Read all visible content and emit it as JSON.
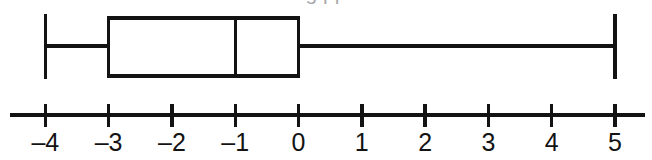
{
  "figure": {
    "kind": "box-plot-on-number-line",
    "ink_color": "#131313",
    "background_color": "#ffffff",
    "cropped_header_remnant": "g pp"
  },
  "axis": {
    "line_y": 115,
    "line_x_start": 10,
    "line_x_end": 645,
    "tick_top_y": 104,
    "tick_bottom_y": 127,
    "label_baseline_y": 151,
    "pixel_per_unit": 63.3,
    "x_at_zero": 298.5,
    "labels": [
      "–4",
      "–3",
      "–2",
      "–1",
      "0",
      "1",
      "2",
      "3",
      "4",
      "5"
    ],
    "values": [
      -4,
      -3,
      -2,
      -1,
      0,
      1,
      2,
      3,
      4,
      5
    ]
  },
  "chart_data": {
    "type": "box",
    "title": "",
    "xlabel": "",
    "ylabel": "",
    "xlim": [
      -4.55,
      5.5
    ],
    "grid": false,
    "legend": "none",
    "categories": [
      "Series 1"
    ],
    "series": [
      {
        "name": "Series 1",
        "min": -4,
        "q1": -3,
        "median": -1,
        "q3": 0,
        "max": 5,
        "outliers": []
      }
    ],
    "tick_values": [
      -4,
      -3,
      -2,
      -1,
      0,
      1,
      2,
      3,
      4,
      5
    ],
    "tick_labels": [
      "–4",
      "–3",
      "–2",
      "–1",
      "0",
      "1",
      "2",
      "3",
      "4",
      "5"
    ]
  },
  "box_geometry": {
    "box_top_y": 18,
    "box_bottom_y": 76,
    "whisker_y": 46,
    "cap_top_y": 14,
    "cap_bottom_y": 79,
    "stroke_width": 3.2,
    "cap_stroke_width": 3.4
  }
}
